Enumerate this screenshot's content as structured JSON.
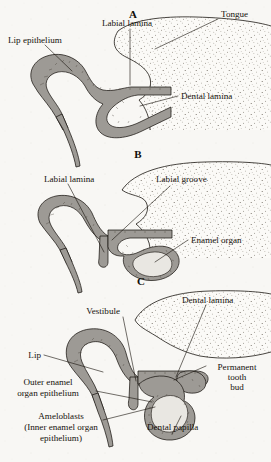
{
  "figure": {
    "background_color": "#f8f7f4",
    "ink_color": "#15110c",
    "epithelium_color": "#9d9a95",
    "mesenchyme_color": "#e9e7e2"
  },
  "panels": [
    {
      "letter": "A",
      "name": "dental-lamina-stage",
      "labels": [
        {
          "id": "labial-lamina",
          "text": "Labial lamina"
        },
        {
          "id": "tongue",
          "text": "Tongue"
        },
        {
          "id": "lip-epithelium",
          "text": "Lip epithelium"
        },
        {
          "id": "dental-lamina",
          "text": "Dental lamina"
        }
      ]
    },
    {
      "letter": "B",
      "name": "cap-stage",
      "labels": [
        {
          "id": "labial-lamina",
          "text": "Labial lamina"
        },
        {
          "id": "labial-groove",
          "text": "Labial groove"
        },
        {
          "id": "enamel-organ",
          "text": "Enamel organ"
        }
      ]
    },
    {
      "letter": "C",
      "name": "bell-stage",
      "labels": [
        {
          "id": "vestibule",
          "text": "Vestibule"
        },
        {
          "id": "dental-lamina",
          "text": "Dental lamina"
        },
        {
          "id": "lip",
          "text": "Lip"
        },
        {
          "id": "permanent-tooth-bud",
          "lines": [
            "Permanent",
            "tooth",
            "bud"
          ]
        },
        {
          "id": "outer-enamel-organ-epithelium",
          "lines": [
            "Outer enamel",
            "organ epithelium"
          ]
        },
        {
          "id": "ameloblasts",
          "lines": [
            "Ameloblasts",
            "(Inner enamel organ",
            "epithelium)"
          ]
        },
        {
          "id": "dental-papilla",
          "text": "Dental papilla"
        }
      ]
    }
  ]
}
